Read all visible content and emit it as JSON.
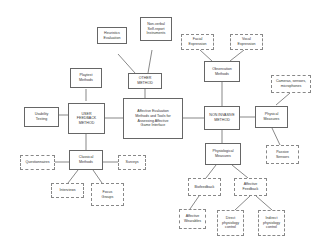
{
  "diagram": {
    "root": "Affective Evaluation\nMethods and Tools for\nAssessing Affective\nGame Interface",
    "nodes": {
      "heuristics": "Heuristics\nEvaluation",
      "nonverbal": "Non-verbal\nSelf-report\nInstruments",
      "other_method": "OTHER\nMETHOD",
      "playtest": "Playtest\nMethods",
      "usability": "Usability\nTesting",
      "user_feedback": "USER\nFEEDBACK\nMETHOD",
      "classical": "Classical\nMethods",
      "questionnaires": "Questionnaires",
      "surveys": "Surveys",
      "interviews": "Interviews",
      "focus_groups": "Focus\nGroups",
      "facial": "Facial\nExpression",
      "vocal": "Vocal\nExpression",
      "observation": "Observation\nMethods",
      "non_invasive": "NON INVASIVE\nMETHOD",
      "cameras": "Cameras, sensors,\nmicrophones",
      "physical": "Physical\nMeasures",
      "passive": "Passive\nSensors",
      "physiological": "Physiological\nMeasures",
      "biofeedback": "Biofeedback",
      "affective_feedback": "Affective\nFeedback",
      "wearables": "Affective\nWearables",
      "direct": "Direct\nphysiology\ncontrol",
      "indirect": "Indirect\nphysiology\ncontrol"
    }
  }
}
